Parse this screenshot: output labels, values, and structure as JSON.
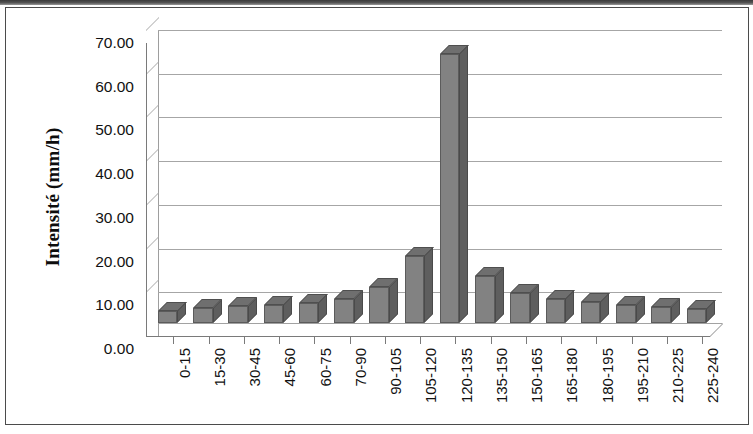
{
  "figure": {
    "background_color": "#ffffff",
    "frame_color": "#4b4b4b",
    "bar_color": "#828282",
    "gridline_color": "#a6a6a6",
    "axis_color": "#7a7a7a"
  },
  "chart_data": {
    "type": "bar",
    "title": "",
    "subtitle": "",
    "xlabel": "",
    "ylabel": "Intensité (mm/h)",
    "ylim": [
      0,
      70
    ],
    "ytick_labels": [
      "70.00",
      "60.00",
      "50.00",
      "40.00",
      "30.00",
      "20.00",
      "10.00",
      "0.00"
    ],
    "ytick_values": [
      70,
      60,
      50,
      40,
      30,
      20,
      10,
      0
    ],
    "grid": true,
    "legend": null,
    "legend_position": "none",
    "categories": [
      "0-15",
      "15-30",
      "30-45",
      "45-60",
      "60-75",
      "70-90",
      "90-105",
      "105-120",
      "120-135",
      "135-150",
      "150-165",
      "165-180",
      "180-195",
      "195-210",
      "210-225",
      "225-240"
    ],
    "values": [
      2.8,
      3.4,
      3.8,
      4.1,
      4.6,
      5.6,
      8.3,
      15.3,
      61.5,
      10.8,
      6.8,
      5.5,
      4.8,
      4.2,
      3.6,
      3.2
    ],
    "annotations": []
  }
}
